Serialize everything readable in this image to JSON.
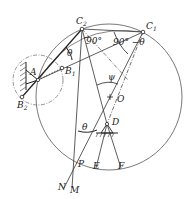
{
  "diagram": {
    "type": "mechanism-synthesis geometric diagram",
    "labels": {
      "C2": "C",
      "C2_sub": "2",
      "C1": "C",
      "C1_sub": "1",
      "A": "A",
      "B1": "B",
      "B1_sub": "1",
      "B2": "B",
      "B2_sub": "2",
      "O": "O",
      "D": "D",
      "P": "P",
      "E": "E",
      "F": "F",
      "N": "N",
      "M": "M",
      "theta_top": "θ",
      "theta_bottom": "θ",
      "angle_90": "90°",
      "angle_90_minus": "90° −θ",
      "psi": "ψ"
    },
    "colors": {
      "line": "#333333",
      "background": "#ffffff"
    }
  }
}
